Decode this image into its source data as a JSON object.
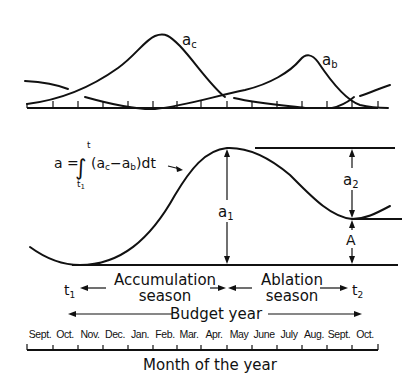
{
  "diagram": {
    "top_panel": {
      "curve_labels": {
        "accumulation": "a",
        "accumulation_sub": "c",
        "ablation": "a",
        "ablation_sub": "b"
      }
    },
    "middle_panel": {
      "formula": {
        "lhs": "a = ",
        "integral": "∫",
        "upper": "t",
        "lower": "t",
        "lower_sub": "1",
        "integrand": "(a",
        "sub_c": "c",
        "minus": "−a",
        "sub_b": "b",
        "tail": ")dt"
      },
      "labels": {
        "a1": "a",
        "a1_sub": "1",
        "a2": "a",
        "a2_sub": "2",
        "A": "A"
      }
    },
    "seasons": {
      "t1": "t",
      "t1_sub": "1",
      "t2": "t",
      "t2_sub": "2",
      "accumulation_line1": "Accumulation",
      "accumulation_line2": "season",
      "ablation_line1": "Ablation",
      "ablation_line2": "season",
      "budget_year": "Budget year"
    },
    "month_axis": {
      "months": [
        "Sept.",
        "Oct.",
        "Nov.",
        "Dec.",
        "Jan.",
        "Feb.",
        "Mar.",
        "Apr.",
        "May",
        "June",
        "July",
        "Aug.",
        "Sept.",
        "Oct."
      ],
      "title": "Month of the year"
    }
  }
}
